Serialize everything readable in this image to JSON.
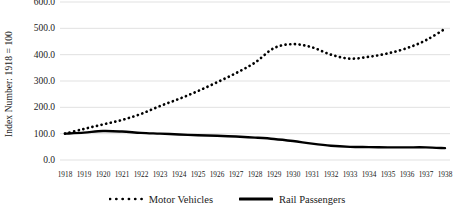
{
  "chart_data": {
    "type": "line",
    "title": "",
    "xlabel": "",
    "ylabel": "Index Number: 1918 = 100",
    "x": [
      1918,
      1919,
      1920,
      1921,
      1922,
      1923,
      1924,
      1925,
      1926,
      1927,
      1928,
      1929,
      1930,
      1931,
      1932,
      1933,
      1934,
      1935,
      1936,
      1937,
      1938
    ],
    "categories": [
      "1918",
      "1919",
      "1920",
      "1921",
      "1922",
      "1923",
      "1924",
      "1925",
      "1926",
      "1927",
      "1928",
      "1929",
      "1930",
      "1931",
      "1932",
      "1933",
      "1934",
      "1935",
      "1936",
      "1937",
      "1938"
    ],
    "series": [
      {
        "name": "Motor Vehicles",
        "style": "dotted",
        "color": "#000000",
        "values": [
          100,
          118,
          135,
          152,
          175,
          205,
          232,
          262,
          295,
          330,
          370,
          425,
          440,
          428,
          400,
          385,
          392,
          405,
          425,
          455,
          498
        ]
      },
      {
        "name": "Rail Passengers",
        "style": "solid",
        "color": "#000000",
        "values": [
          100,
          104,
          110,
          108,
          103,
          100,
          97,
          94,
          92,
          89,
          85,
          80,
          72,
          62,
          54,
          50,
          49,
          48,
          48,
          48,
          45
        ]
      }
    ],
    "ylim": [
      0,
      600
    ],
    "ytick_values": [
      0,
      100,
      200,
      300,
      400,
      500,
      600
    ],
    "ytick_labels": [
      "0.0",
      "100.0",
      "200.0",
      "300.0",
      "400.0",
      "500.0",
      "600.0"
    ],
    "grid": {
      "horizontal": true,
      "vertical": false,
      "color": "#d9d9d9"
    },
    "legend": {
      "position": "bottom",
      "entries": [
        {
          "label": "Motor Vehicles",
          "style": "dotted"
        },
        {
          "label": "Rail Passengers",
          "style": "solid"
        }
      ]
    }
  }
}
